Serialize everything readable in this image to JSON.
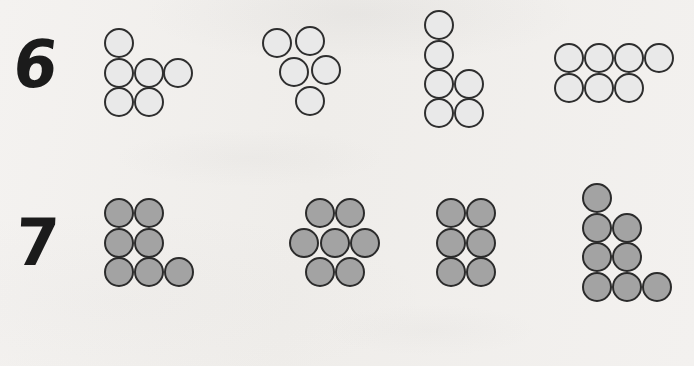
{
  "page": {
    "background_color": "#f2f0ee",
    "width": 694,
    "height": 366
  },
  "rows": [
    {
      "label": "6",
      "label_x": 14,
      "label_y": 34,
      "dot_style": "light",
      "dot_fill": "#e9e9e9",
      "dot_stroke": "#2e2e2e",
      "dot_size": 30,
      "groups": [
        {
          "name": "group-1",
          "count": 6,
          "arrangement": "1 top-left, 3 middle, 2 bottom",
          "x": 104,
          "y": 28,
          "dots": [
            {
              "cx": 15,
              "cy": 15
            },
            {
              "cx": 15,
              "cy": 45
            },
            {
              "cx": 45,
              "cy": 45
            },
            {
              "cx": 74,
              "cy": 45
            },
            {
              "cx": 15,
              "cy": 74
            },
            {
              "cx": 45,
              "cy": 74
            }
          ]
        },
        {
          "name": "group-2",
          "count": 5,
          "arrangement": "2 top, 2 middle offset, 1 bottom",
          "x": 262,
          "y": 28,
          "dots": [
            {
              "cx": 15,
              "cy": 15
            },
            {
              "cx": 48,
              "cy": 13
            },
            {
              "cx": 32,
              "cy": 44
            },
            {
              "cx": 64,
              "cy": 42
            },
            {
              "cx": 48,
              "cy": 73
            }
          ]
        },
        {
          "name": "group-3",
          "count": 6,
          "arrangement": "column of 2, then 2 rows of 2",
          "x": 424,
          "y": 10,
          "dots": [
            {
              "cx": 15,
              "cy": 15
            },
            {
              "cx": 15,
              "cy": 45
            },
            {
              "cx": 15,
              "cy": 74
            },
            {
              "cx": 45,
              "cy": 74
            },
            {
              "cx": 15,
              "cy": 103
            },
            {
              "cx": 45,
              "cy": 103
            }
          ]
        },
        {
          "name": "group-4",
          "count": 7,
          "arrangement": "4 top, 3 bottom",
          "x": 554,
          "y": 43,
          "dots": [
            {
              "cx": 15,
              "cy": 15
            },
            {
              "cx": 45,
              "cy": 15
            },
            {
              "cx": 75,
              "cy": 15
            },
            {
              "cx": 105,
              "cy": 15
            },
            {
              "cx": 15,
              "cy": 45
            },
            {
              "cx": 45,
              "cy": 45
            },
            {
              "cx": 75,
              "cy": 45
            }
          ]
        }
      ]
    },
    {
      "label": "7",
      "label_x": 16,
      "label_y": 212,
      "dot_style": "dark",
      "dot_fill": "#a3a3a3",
      "dot_stroke": "#2b2b2b",
      "dot_size": 30,
      "groups": [
        {
          "name": "group-1",
          "count": 7,
          "arrangement": "2 top, 2 middle, 3 bottom",
          "x": 104,
          "y": 198,
          "dots": [
            {
              "cx": 15,
              "cy": 15
            },
            {
              "cx": 45,
              "cy": 15
            },
            {
              "cx": 15,
              "cy": 45
            },
            {
              "cx": 45,
              "cy": 45
            },
            {
              "cx": 15,
              "cy": 74
            },
            {
              "cx": 45,
              "cy": 74
            },
            {
              "cx": 75,
              "cy": 74
            }
          ]
        },
        {
          "name": "group-2",
          "count": 7,
          "arrangement": "2 top, 3 middle, 2 bottom hexagonal",
          "x": 289,
          "y": 198,
          "dots": [
            {
              "cx": 31,
              "cy": 15
            },
            {
              "cx": 61,
              "cy": 15
            },
            {
              "cx": 15,
              "cy": 45
            },
            {
              "cx": 46,
              "cy": 45
            },
            {
              "cx": 76,
              "cy": 45
            },
            {
              "cx": 31,
              "cy": 74
            },
            {
              "cx": 61,
              "cy": 74
            }
          ]
        },
        {
          "name": "group-3",
          "count": 6,
          "arrangement": "2 columns by 3 rows",
          "x": 436,
          "y": 198,
          "dots": [
            {
              "cx": 15,
              "cy": 15
            },
            {
              "cx": 45,
              "cy": 15
            },
            {
              "cx": 15,
              "cy": 45
            },
            {
              "cx": 45,
              "cy": 45
            },
            {
              "cx": 15,
              "cy": 74
            },
            {
              "cx": 45,
              "cy": 74
            }
          ]
        },
        {
          "name": "group-4",
          "count": 8,
          "arrangement": "staircase: 1, 2, 2, 3",
          "x": 582,
          "y": 183,
          "dots": [
            {
              "cx": 15,
              "cy": 15
            },
            {
              "cx": 15,
              "cy": 45
            },
            {
              "cx": 45,
              "cy": 45
            },
            {
              "cx": 15,
              "cy": 74
            },
            {
              "cx": 45,
              "cy": 74
            },
            {
              "cx": 15,
              "cy": 104
            },
            {
              "cx": 45,
              "cy": 104
            },
            {
              "cx": 75,
              "cy": 104
            }
          ]
        }
      ]
    }
  ]
}
